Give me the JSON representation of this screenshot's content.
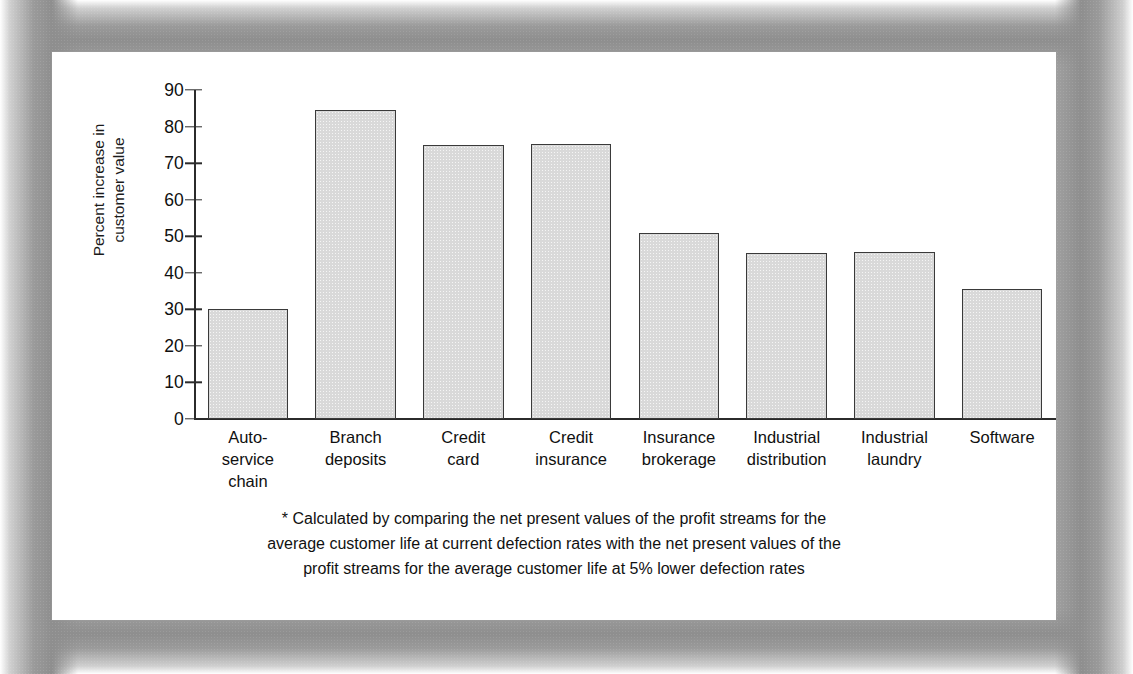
{
  "chart_data": {
    "type": "bar",
    "title": "",
    "xlabel": "",
    "ylabel": "Percent increase in customer value",
    "ylabel_lines": [
      "Percent increase in",
      "customer value"
    ],
    "ylim": [
      0,
      90
    ],
    "yticks": [
      0,
      10,
      20,
      30,
      40,
      50,
      60,
      70,
      80,
      90
    ],
    "ytick_labels": [
      "0",
      "10",
      "20",
      "30",
      "40",
      "50",
      "60",
      "70",
      "80",
      "90"
    ],
    "grid": false,
    "legend": false,
    "categories": [
      "Auto-\nservice\nchain",
      "Branch\ndeposits",
      "Credit\ncard",
      "Credit\ninsurance",
      "Insurance\nbrokerage",
      "Industrial\ndistribution",
      "Industrial\nlaundry",
      "Software"
    ],
    "values": [
      30,
      84.5,
      75,
      75.3,
      51,
      45.5,
      45.8,
      35.7
    ],
    "bar_color": "#d9d9d9",
    "bar_edge_color": "#3a3a3a",
    "axis_color": "#2b2b2b"
  },
  "footnote": {
    "lines": [
      "* Calculated by comparing the net present values of the profit streams for the",
      "average customer life at current defection rates with the net present values of the",
      "profit streams for the average customer life at 5% lower defection rates"
    ]
  },
  "colors": {
    "page_background": "#ffffff",
    "frame_gray": "#8e8e8e",
    "text": "#111111"
  }
}
